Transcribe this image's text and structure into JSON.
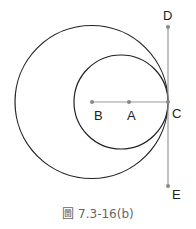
{
  "figure": {
    "caption": "圖 7.3-16(b)",
    "points": {
      "A": "A",
      "B": "B",
      "C": "C",
      "D": "D",
      "E": "E"
    },
    "colors": {
      "circles": "#222222",
      "lines": "#999999",
      "points": "#888888"
    }
  }
}
